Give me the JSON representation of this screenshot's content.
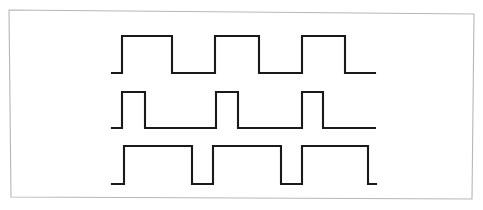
{
  "figure": {
    "background_color": "#ffffff",
    "border_color": "#b6b6b6",
    "trace_color": "#1a1a1a",
    "trace_width": 2.1,
    "frame": {
      "points": "9,10 474,14 472,199 11,197",
      "description": "thin hand-drawn rectangular frame, slightly skewed"
    }
  },
  "chart_data": {
    "type": "line",
    "xlabel": "",
    "ylabel": "",
    "grid": false,
    "legend": null,
    "xlim": [
      112,
      376
    ],
    "series": [
      {
        "name": "top-waveform",
        "duty_cycle_percent": 50,
        "high_level_y": 36,
        "low_level_y": 73,
        "points": "112,73 122,73 122,36 172,36 172,73 215,73 215,36 259,36 259,73 302,73 302,36 345,36 345,73 375,73",
        "transitions_x": [
          122,
          172,
          215,
          259,
          302,
          345
        ],
        "pulse_count": 3
      },
      {
        "name": "middle-waveform",
        "duty_cycle_percent": 25,
        "high_level_y": 92,
        "low_level_y": 128,
        "points": "112,128 122,128 122,92 145,92 145,128 216,128 216,92 238,92 238,128 302,128 302,92 323,92 323,128 375,128",
        "transitions_x": [
          122,
          145,
          216,
          238,
          302,
          323
        ],
        "pulse_count": 3
      },
      {
        "name": "bottom-waveform",
        "duty_cycle_percent": 75,
        "high_level_y": 146,
        "low_level_y": 184,
        "points": "112,184 124,184 124,146 192,146 192,184 213,184 213,146 281,146 281,184 302,184 302,146 368,146 368,184 376,184",
        "transitions_x": [
          124,
          192,
          213,
          281,
          302,
          368
        ],
        "pulse_count": 3
      }
    ]
  }
}
